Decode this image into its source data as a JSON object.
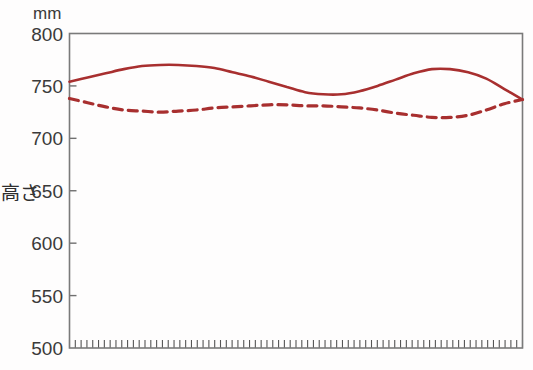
{
  "chart_data": {
    "type": "line",
    "title": "",
    "subtitle": "",
    "xlabel": "",
    "ylabel": "高さ",
    "unit_label": "mm",
    "ylim": [
      500,
      800
    ],
    "yticks": [
      500,
      550,
      600,
      650,
      700,
      750,
      800
    ],
    "ytick_labels": [
      "500",
      "550",
      "600",
      "650",
      "700",
      "750",
      "800"
    ],
    "xlim": [
      0,
      100
    ],
    "xticks_count": 78,
    "xtick_labels": [],
    "grid": false,
    "legend": false,
    "legend_position": "none",
    "series": [
      {
        "name": "solid-line",
        "style": "solid",
        "color": "#a82f2f",
        "x": [
          0,
          4,
          8,
          12,
          16,
          20,
          24,
          28,
          32,
          36,
          40,
          44,
          48,
          52,
          56,
          60,
          64,
          68,
          72,
          76,
          80,
          84,
          88,
          92,
          96,
          100
        ],
        "values": [
          754,
          758,
          762,
          766,
          769,
          770,
          770,
          769,
          767,
          763,
          759,
          754,
          749,
          744,
          742,
          742,
          745,
          750,
          756,
          762,
          766,
          766,
          763,
          757,
          747,
          737
        ]
      },
      {
        "name": "dashed-line",
        "style": "dashed",
        "color": "#a82f2f",
        "x": [
          0,
          4,
          8,
          12,
          16,
          20,
          24,
          28,
          32,
          36,
          40,
          44,
          48,
          52,
          56,
          60,
          64,
          68,
          72,
          76,
          80,
          84,
          88,
          92,
          96,
          100
        ],
        "values": [
          738,
          734,
          730,
          727,
          726,
          725,
          726,
          727,
          729,
          730,
          731,
          732,
          732,
          731,
          731,
          730,
          729,
          727,
          724,
          722,
          720,
          720,
          722,
          727,
          733,
          737
        ]
      }
    ]
  },
  "axis": {
    "y_unit": "mm",
    "y_title": "高さ",
    "y_min_label": "500",
    "y_max_label": "800"
  },
  "colors": {
    "line": "#a82f2f",
    "axis": "#6f6f6f",
    "text": "#3a3a3a",
    "background": "#fefdfd"
  }
}
